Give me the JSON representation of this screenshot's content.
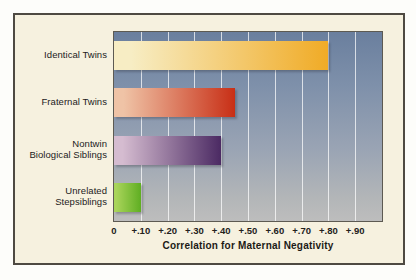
{
  "chart_data": {
    "type": "bar",
    "orientation": "horizontal",
    "title": "",
    "xlabel": "Correlation for Maternal Negativity",
    "ylabel": "",
    "categories": [
      "Identical Twins",
      "Fraternal Twins",
      "Nontwin Biological Siblings",
      "Unrelated Stepsiblings"
    ],
    "category_lines": [
      [
        "Identical Twins"
      ],
      [
        "Fraternal Twins"
      ],
      [
        "Nontwin",
        "Biological Siblings"
      ],
      [
        "Unrelated",
        "Stepsiblings"
      ]
    ],
    "values": [
      0.8,
      0.45,
      0.4,
      0.1
    ],
    "xlim": [
      0,
      1.0
    ],
    "xticks": [
      0,
      0.1,
      0.2,
      0.3,
      0.4,
      0.5,
      0.6,
      0.7,
      0.8,
      0.9
    ],
    "xtick_labels": [
      "0",
      "+.10",
      "+.20",
      "+.30",
      "+.40",
      "+.50",
      "+.60",
      "+.70",
      "+.80",
      "+.90"
    ],
    "grid": true,
    "legend": "none",
    "bar_colors": [
      {
        "name": "identical-twins-bar",
        "start": "#f7edc4",
        "end": "#f0ab26"
      },
      {
        "name": "fraternal-twins-bar",
        "start": "#efc3a6",
        "end": "#c82f16"
      },
      {
        "name": "nontwin-biological-siblings-bar",
        "start": "#d5bcd0",
        "end": "#4b2a63"
      },
      {
        "name": "unrelated-stepsiblings-bar",
        "start": "#a9d45a",
        "end": "#5fae22"
      }
    ],
    "plot_background": {
      "top": "#6a7f9e",
      "bottom": "#bdbdbd"
    },
    "gridline_color": "#ffffff"
  },
  "panel": {
    "background_color": "#f6f1df",
    "border_color": "#4e4a42"
  }
}
